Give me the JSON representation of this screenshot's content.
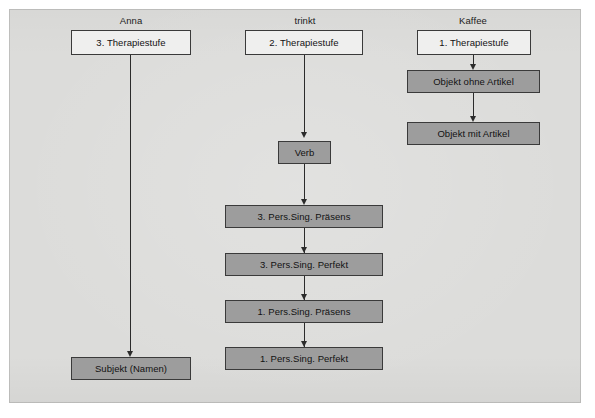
{
  "page": {
    "background_color": "#ffffff",
    "sheet_color": "#dcdcda",
    "node_white_fill": "#efefee",
    "node_gray_fill": "#9d9d9d",
    "stroke_color": "#3a3a3a",
    "text_color": "#121212"
  },
  "columns": [
    {
      "id": "col-anna",
      "header": "Anna"
    },
    {
      "id": "col-trinkt",
      "header": "trinkt"
    },
    {
      "id": "col-kaffee",
      "header": "Kaffee"
    }
  ],
  "nodes": {
    "anna_stufe": "3. Therapiestufe",
    "anna_subjekt": "Subjekt (Namen)",
    "trinkt_stufe": "2. Therapiestufe",
    "trinkt_verb": "Verb",
    "trinkt_3sg_praes": "3. Pers.Sing. Präsens",
    "trinkt_3sg_perf": "3. Pers.Sing. Perfekt",
    "trinkt_1sg_praes": "1. Pers.Sing. Präsens",
    "trinkt_1sg_perf": "1. Pers.Sing. Perfekt",
    "kaffee_stufe": "1. Therapiestufe",
    "kaffee_ohne": "Objekt ohne Artikel",
    "kaffee_mit": "Objekt mit Artikel"
  }
}
